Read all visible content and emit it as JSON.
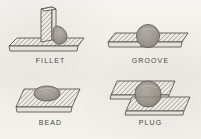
{
  "figure": {
    "title_visible": false,
    "background_color": "#f3f1ec",
    "ink_color": "#4a4742",
    "hatch_color": "#6b6760",
    "weld_fill_color": "#9a958d",
    "style": "isometric line drawing with diagonal section hatching",
    "layout": "2x2 grid"
  },
  "panels": [
    {
      "id": "fillet",
      "caption": "FILLET",
      "description": "vertical plate joined perpendicular to a horizontal base plate with a weld bead in the corner",
      "parts": [
        "vertical-plate",
        "base-plate",
        "weld-bead"
      ],
      "weld_shape": "teardrop-bead",
      "grid_position": "top-left"
    },
    {
      "id": "groove",
      "caption": "GROOVE",
      "description": "two coplanar plates butted edge to edge with a round weld nugget spanning the joint",
      "parts": [
        "left-plate",
        "right-plate",
        "weld-nugget"
      ],
      "weld_shape": "round-nugget",
      "grid_position": "top-right"
    },
    {
      "id": "bead",
      "caption": "BEAD",
      "description": "single flat plate with an oval weld bead deposited on its top surface",
      "parts": [
        "base-plate",
        "weld-bead"
      ],
      "weld_shape": "flat-oval-bead",
      "grid_position": "bottom-left"
    },
    {
      "id": "plug",
      "caption": "PLUG",
      "description": "two overlapping offset plates joined by a circular plug weld passing through both",
      "parts": [
        "upper-plate",
        "lower-plate",
        "weld-plug"
      ],
      "weld_shape": "round-plug",
      "grid_position": "bottom-right"
    }
  ]
}
